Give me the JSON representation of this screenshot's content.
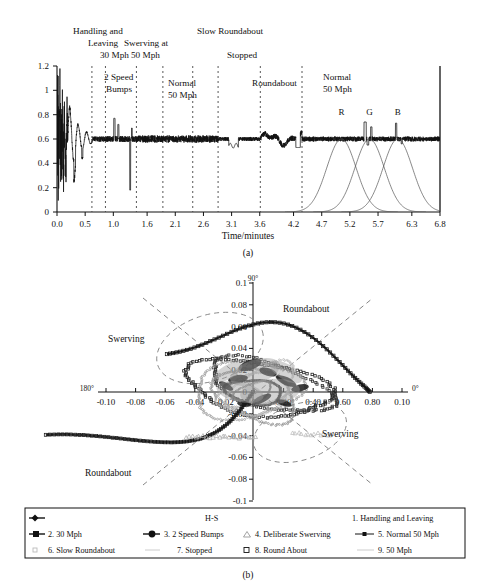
{
  "figure": {
    "panel_a_label": "(a)",
    "panel_b_label": "(b)"
  },
  "chart_data": [
    {
      "type": "line",
      "id": "panel-a",
      "title": "",
      "xlabel": "Time/minutes",
      "ylabel": "",
      "xlim": [
        0.0,
        6.8
      ],
      "ylim": [
        0,
        1.2
      ],
      "grid": false,
      "baseline": 0.6,
      "xticks": [
        "0.0",
        "0.5",
        "1.0",
        "1.6",
        "2.1",
        "2.6",
        "3.1",
        "3.6",
        "4.2",
        "4.7",
        "5.2",
        "5.7",
        "6.3",
        "6.8"
      ],
      "xtick_values": [
        0.0,
        0.5,
        1.0,
        1.6,
        2.1,
        2.6,
        3.1,
        3.6,
        4.2,
        4.7,
        5.2,
        5.7,
        6.3,
        6.8
      ],
      "yticks": [
        "0",
        "0.2",
        "0.4",
        "0.6",
        "0.8",
        "1",
        "1.2"
      ],
      "ytick_values": [
        0,
        0.2,
        0.4,
        0.6,
        0.8,
        1.0,
        1.2
      ],
      "segment_dividers": [
        0.62,
        0.86,
        1.41,
        1.88,
        2.41,
        2.86,
        3.61,
        4.35
      ],
      "annotations_above": [
        {
          "text": "Handling and",
          "x": 0.3,
          "row": 0
        },
        {
          "text": "Leaving",
          "x": 0.38,
          "row": 1
        },
        {
          "text": "30 Mph",
          "x": 0.62,
          "row": 2
        },
        {
          "text": "Swerving at",
          "x": 1.25,
          "row": 1
        },
        {
          "text": "50 Mph",
          "x": 1.25,
          "row": 2
        },
        {
          "text": "Slow Roundabout",
          "x": 2.72,
          "row": 0
        },
        {
          "text": "Stopped",
          "x": 3.18,
          "row": 2
        }
      ],
      "annotations_inside": [
        {
          "text": "2 Speed",
          "x": 1.02,
          "y": 1.02
        },
        {
          "text": "Bumps",
          "x": 1.02,
          "y": 0.91
        },
        {
          "text": "Normal",
          "x": 2.12,
          "y": 0.95
        },
        {
          "text": "50 Mph",
          "x": 2.12,
          "y": 0.84
        },
        {
          "text": "Roundabout",
          "x": 3.92,
          "y": 0.95
        },
        {
          "text": "Normal",
          "x": 5.02,
          "y": 1.03
        },
        {
          "text": "50 Mph",
          "x": 5.02,
          "y": 0.92
        }
      ],
      "peaks": [
        {
          "label": "R",
          "center": 5.05,
          "sigma": 0.26,
          "label_y": 0.8
        },
        {
          "label": "G",
          "center": 5.55,
          "sigma": 0.26,
          "label_y": 0.8
        },
        {
          "label": "B",
          "center": 6.05,
          "sigma": 0.26,
          "label_y": 0.8
        }
      ],
      "series": [
        {
          "name": "H-S signal",
          "description": "noisy vibration trace settling to 0.6 baseline"
        }
      ]
    },
    {
      "type": "scatter",
      "id": "panel-b",
      "title": "",
      "xlabel": "",
      "ylabel": "",
      "xlim": [
        -0.11,
        0.11
      ],
      "ylim": [
        -0.1,
        0.1
      ],
      "grid": false,
      "angle_labels": [
        {
          "text": "90°",
          "position": "top"
        },
        {
          "text": "180°",
          "position": "left"
        },
        {
          "text": "0°",
          "position": "right"
        }
      ],
      "xticks": [
        "-0.10",
        "-0.08",
        "-0.06",
        "-0.04",
        "-0.02",
        "0",
        "0.20",
        "0.40",
        "0.60",
        "0.80",
        "0.10"
      ],
      "yticks": [
        "0.1",
        "0.08",
        "0.06",
        "0.04",
        "0.02",
        "0",
        "-0.02",
        "-0.04",
        "-0.06",
        "-0.08",
        "-0.1"
      ],
      "ytick_values": [
        0.1,
        0.08,
        0.06,
        0.04,
        0.02,
        0,
        -0.02,
        -0.04,
        -0.06,
        -0.08,
        -0.1
      ],
      "region_labels": [
        {
          "text": "Swerving",
          "x": -0.062,
          "y": 0.046
        },
        {
          "text": "Roundabout",
          "x": 0.03,
          "y": 0.056
        },
        {
          "text": "Swerving",
          "x": 0.05,
          "y": -0.042
        },
        {
          "text": "Roundabout",
          "x": -0.07,
          "y": -0.072
        }
      ]
    }
  ],
  "legend": {
    "header": "H-S",
    "items": [
      {
        "num": "1.",
        "label": "1. Handling and Leaving",
        "marker": "line-diamond"
      },
      {
        "num": "2.",
        "label": "2. 30 Mph",
        "marker": "filled-square"
      },
      {
        "num": "3.",
        "label": "3. 2 Speed Bumps",
        "marker": "line-circle"
      },
      {
        "num": "4.",
        "label": "4. Deliberate Swerving",
        "marker": "triangle"
      },
      {
        "num": "5.",
        "label": "5. Normal 50 Mph",
        "marker": "line-dot"
      },
      {
        "num": "6.",
        "label": "6. Slow Roundabout",
        "marker": "faint-dot"
      },
      {
        "num": "7.",
        "label": "7. Stopped",
        "marker": "faint-line"
      },
      {
        "num": "8.",
        "label": "8. Round About",
        "marker": "open-square"
      },
      {
        "num": "9.",
        "label": "9. 50 Mph",
        "marker": "faint-line"
      }
    ]
  }
}
